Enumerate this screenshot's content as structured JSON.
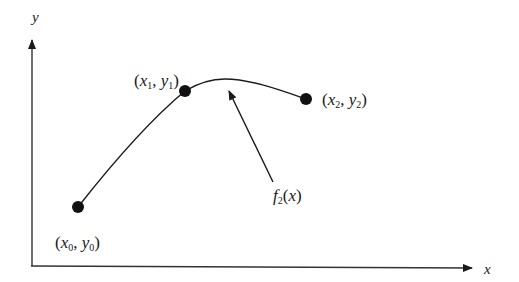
{
  "diagram": {
    "axes": {
      "x_label": "x",
      "y_label": "y"
    },
    "points": [
      {
        "id": "p0",
        "x_sym": "x",
        "y_sym": "y",
        "sub": "0",
        "label": "(x0, y0)"
      },
      {
        "id": "p1",
        "x_sym": "x",
        "y_sym": "y",
        "sub": "1",
        "label": "(x1, y1)"
      },
      {
        "id": "p2",
        "x_sym": "x",
        "y_sym": "y",
        "sub": "2",
        "label": "(x2, y2)"
      }
    ],
    "curve": {
      "func": "f",
      "sub": "2",
      "arg": "x",
      "label": "f2(x)"
    },
    "colors": {
      "stroke": "#1a1a1a",
      "point_fill": "#111111",
      "background": "#ffffff"
    }
  }
}
